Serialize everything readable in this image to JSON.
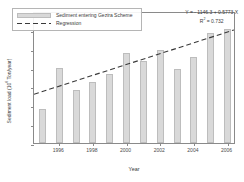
{
  "chart_data": {
    "type": "bar",
    "title": "",
    "xlabel": "Year",
    "ylabel": "Sediment load (10^6 Ton/year)",
    "ylabel_prefix": "Sediment load (10",
    "ylabel_exponent": "6",
    "ylabel_suffix": " Ton/year)",
    "categories": [
      1995,
      1996,
      1997,
      1998,
      1999,
      2000,
      2001,
      2002,
      2003,
      2004,
      2005,
      2006
    ],
    "values": [
      3.6,
      8.0,
      5.6,
      6.5,
      7.3,
      9.5,
      8.7,
      9.9,
      7.85,
      9.1,
      11.7,
      12.1
    ],
    "series": [
      {
        "name": "Sediment entering Gezira Scheme",
        "values": [
          3.6,
          8.0,
          5.6,
          6.5,
          7.3,
          9.5,
          8.7,
          9.9,
          7.85,
          9.1,
          11.7,
          12.1
        ]
      }
    ],
    "xlim": [
      1994.5,
      2006.5
    ],
    "ylim": [
      0,
      14
    ],
    "yticks": [
      0,
      2,
      4,
      6,
      8,
      10,
      12,
      14
    ],
    "ytick_labels": [
      "0",
      "2",
      "4",
      "6",
      "8",
      "10",
      "12",
      "14"
    ],
    "xticks": [
      1996,
      1998,
      2000,
      2002,
      2004,
      2006
    ],
    "xtick_labels": [
      "1996",
      "1998",
      "2000",
      "2002",
      "2004",
      "2006"
    ],
    "grid": false,
    "legend_position": "top-left",
    "regression": {
      "name": "Regression",
      "slope": 0.5773,
      "intercept": -1146.3,
      "r_squared": 0.732,
      "x_start": 1994.5,
      "x_end": 2006.5,
      "y_start": 5.25,
      "y_end": 12.18,
      "style": "dashed",
      "color": "#3a3a3a"
    },
    "annotations": {
      "equation": "Y = - 1146.3 + 0.5773 X",
      "r_squared_prefix": "R",
      "r_squared_exponent": "2",
      "r_squared_value": " = 0.732"
    },
    "colors": {
      "bar_fill": "#d9d9d9",
      "bar_edge": "#bdbdbd",
      "axis": "#8a8a8a",
      "text": "#3a3a3a",
      "regression": "#3a3a3a"
    }
  },
  "legend": {
    "items": [
      {
        "label": "Sediment entering Gezira Scheme",
        "marker": "bar-swatch"
      },
      {
        "label": "Regression",
        "marker": "dashed-line-swatch"
      }
    ]
  }
}
